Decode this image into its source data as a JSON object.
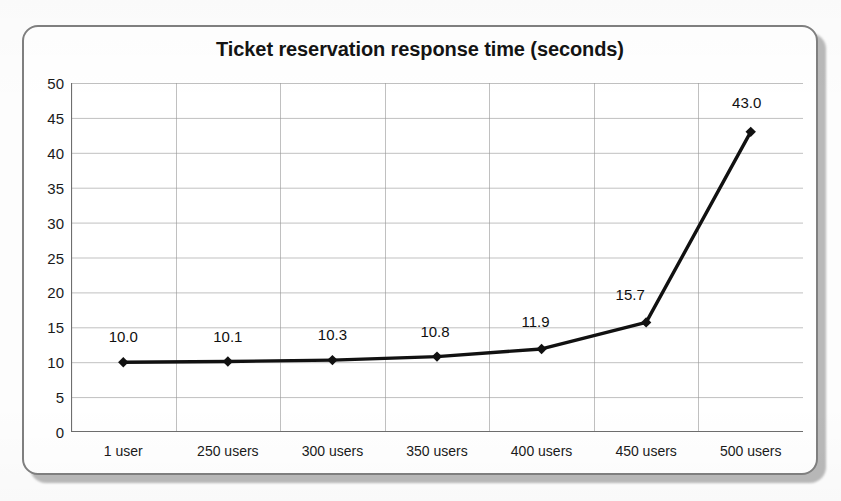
{
  "chart_data": {
    "type": "line",
    "title": "Ticket reservation response time (seconds)",
    "xlabel": "",
    "ylabel": "",
    "categories": [
      "1 user",
      "250 users",
      "300 users",
      "350 users",
      "400 users",
      "450 users",
      "500 users"
    ],
    "values": [
      10.0,
      10.1,
      10.3,
      10.8,
      11.9,
      15.7,
      43.0
    ],
    "point_labels": [
      "10.0",
      "10.1",
      "10.3",
      "10.8",
      "11.9",
      "15.7",
      "43.0"
    ],
    "ylim": [
      0,
      50
    ],
    "ytick_step": 5,
    "ytick_labels": [
      "50",
      "45",
      "40",
      "35",
      "30",
      "25",
      "20",
      "15",
      "10",
      "5",
      "0"
    ],
    "ytick_values": [
      50,
      45,
      40,
      35,
      30,
      25,
      20,
      15,
      10,
      5,
      0
    ],
    "grid": {
      "horizontal": true,
      "vertical": true,
      "color": "#9a9a9a"
    },
    "legend": null,
    "legend_position": "none",
    "series": [
      {
        "name": "Response time",
        "values": [
          10.0,
          10.1,
          10.3,
          10.8,
          11.9,
          15.7,
          43.0
        ],
        "line_color": "#111111",
        "marker": "diamond",
        "marker_color": "#111111"
      }
    ]
  },
  "frame": {
    "border_color": "#808080",
    "background": "#ffffff"
  }
}
